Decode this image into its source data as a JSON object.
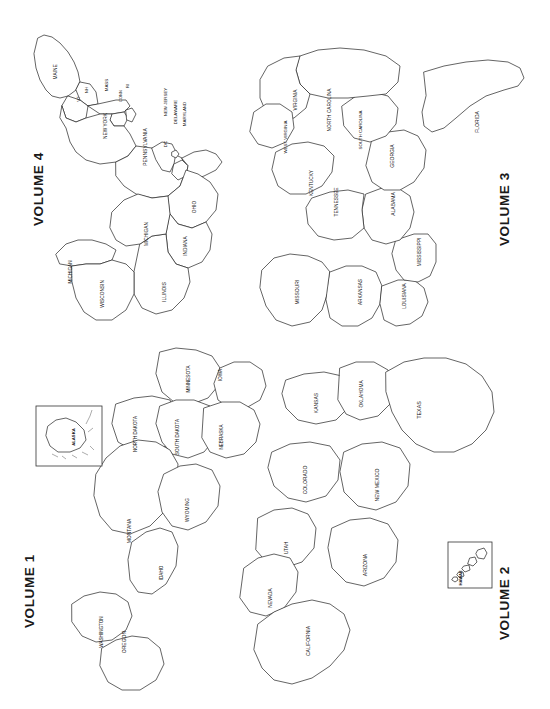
{
  "page": {
    "background_color": "#ffffff",
    "line_color": "#222222",
    "text_color": "#111111",
    "orientation": "map rotated 90 degrees clockwise; all labels read bottom-to-top"
  },
  "volumes": [
    {
      "id": "volume-1",
      "label": "VOLUME 1",
      "region": "northwest",
      "quadrant": "lower-left"
    },
    {
      "id": "volume-2",
      "label": "VOLUME 2",
      "region": "southwest",
      "quadrant": "lower-right"
    },
    {
      "id": "volume-3",
      "label": "VOLUME 3",
      "region": "southeast",
      "quadrant": "upper-right"
    },
    {
      "id": "volume-4",
      "label": "VOLUME 4",
      "region": "northeast",
      "quadrant": "upper-left"
    }
  ],
  "insets": [
    {
      "id": "alaska-inset",
      "label": "ALASKA",
      "belongs_to": "VOLUME 1"
    },
    {
      "id": "hawaii-inset",
      "label": "HAWAII",
      "belongs_to": "VOLUME 2"
    }
  ],
  "states": {
    "volume_1": [
      {
        "name": "WASHINGTON",
        "x": 103,
        "y": 632,
        "size": 4.6
      },
      {
        "name": "OREGON",
        "x": 126,
        "y": 642,
        "size": 5.0
      },
      {
        "name": "IDAHO",
        "x": 163,
        "y": 573,
        "size": 4.6
      },
      {
        "name": "MONTANA",
        "x": 131,
        "y": 531,
        "size": 5.0
      },
      {
        "name": "WYOMING",
        "x": 189,
        "y": 510,
        "size": 4.8
      },
      {
        "name": "NORTH DAKOTA",
        "x": 137,
        "y": 434,
        "size": 4.6
      },
      {
        "name": "SOUTH DAKOTA",
        "x": 179,
        "y": 437,
        "size": 4.6
      },
      {
        "name": "NEBRASKA",
        "x": 223,
        "y": 437,
        "size": 4.6
      },
      {
        "name": "MINNESOTA",
        "x": 190,
        "y": 379,
        "size": 4.6
      },
      {
        "name": "IOWA",
        "x": 222,
        "y": 375,
        "size": 4.8
      }
    ],
    "volume_2": [
      {
        "name": "CALIFORNIA",
        "x": 310,
        "y": 641,
        "size": 5.0
      },
      {
        "name": "NEVADA",
        "x": 272,
        "y": 598,
        "size": 4.8
      },
      {
        "name": "UTAH",
        "x": 288,
        "y": 548,
        "size": 4.8
      },
      {
        "name": "ARIZONA",
        "x": 367,
        "y": 565,
        "size": 5.0
      },
      {
        "name": "COLORADO",
        "x": 307,
        "y": 480,
        "size": 5.0
      },
      {
        "name": "NEW MEXICO",
        "x": 379,
        "y": 485,
        "size": 5.0
      },
      {
        "name": "KANSAS",
        "x": 318,
        "y": 403,
        "size": 5.0
      },
      {
        "name": "OKLAHOMA",
        "x": 363,
        "y": 394,
        "size": 4.8
      },
      {
        "name": "TEXAS",
        "x": 421,
        "y": 410,
        "size": 5.4
      }
    ],
    "volume_3": [
      {
        "name": "MISSOURI",
        "x": 299,
        "y": 292,
        "size": 5.0
      },
      {
        "name": "ARKANSAS",
        "x": 362,
        "y": 292,
        "size": 4.8
      },
      {
        "name": "LOUISIANA",
        "x": 406,
        "y": 296,
        "size": 4.8
      },
      {
        "name": "MISSISSIPPI",
        "x": 421,
        "y": 252,
        "size": 4.8
      },
      {
        "name": "ALABAMA",
        "x": 395,
        "y": 204,
        "size": 5.0
      },
      {
        "name": "TENNESSEE",
        "x": 338,
        "y": 202,
        "size": 4.8
      },
      {
        "name": "KENTUCKY",
        "x": 313,
        "y": 183,
        "size": 4.8
      },
      {
        "name": "WEST VIRGINIA",
        "x": 287,
        "y": 137,
        "size": 4.4
      },
      {
        "name": "VIRGINIA",
        "x": 297,
        "y": 100,
        "size": 4.8
      },
      {
        "name": "NORTH CAROLINA",
        "x": 331,
        "y": 110,
        "size": 4.8
      },
      {
        "name": "SOUTH CAROLINA",
        "x": 362,
        "y": 130,
        "size": 4.4
      },
      {
        "name": "GEORGIA",
        "x": 394,
        "y": 156,
        "size": 5.0
      },
      {
        "name": "FLORIDA",
        "x": 479,
        "y": 122,
        "size": 5.0
      }
    ],
    "volume_4": [
      {
        "name": "MICHIGAN",
        "x": 72,
        "y": 272,
        "size": 4.6
      },
      {
        "name": "WISCONSIN",
        "x": 104,
        "y": 294,
        "size": 4.8
      },
      {
        "name": "MICHIGAN",
        "x": 148,
        "y": 234,
        "size": 4.8
      },
      {
        "name": "ILLINOIS",
        "x": 166,
        "y": 292,
        "size": 4.8
      },
      {
        "name": "INDIANA",
        "x": 187,
        "y": 246,
        "size": 4.8
      },
      {
        "name": "OHIO",
        "x": 196,
        "y": 207,
        "size": 4.8
      },
      {
        "name": "PENNSYLVANIA",
        "x": 147,
        "y": 147,
        "size": 5.0
      },
      {
        "name": "NEW YORK",
        "x": 107,
        "y": 126,
        "size": 4.8
      },
      {
        "name": "MAINE",
        "x": 57,
        "y": 72,
        "size": 4.8
      },
      {
        "name": "VT",
        "x": 80,
        "y": 99,
        "size": 4.4
      },
      {
        "name": "NH",
        "x": 88,
        "y": 90,
        "size": 4.4
      },
      {
        "name": "MASS",
        "x": 108,
        "y": 85,
        "size": 4.4
      },
      {
        "name": "CONN",
        "x": 122,
        "y": 96,
        "size": 4.0
      },
      {
        "name": "RI",
        "x": 129,
        "y": 86,
        "size": 4.0
      },
      {
        "name": "NEW JERSEY",
        "x": 167,
        "y": 102,
        "size": 4.4
      },
      {
        "name": "DELAWARE",
        "x": 177,
        "y": 112,
        "size": 4.4
      },
      {
        "name": "MARYLAND",
        "x": 186,
        "y": 114,
        "size": 4.4
      },
      {
        "name": "DC",
        "x": 167,
        "y": 144,
        "size": 4.4
      }
    ]
  }
}
